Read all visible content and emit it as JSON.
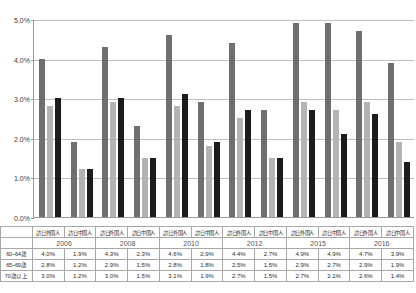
{
  "chart_data": {
    "type": "bar",
    "title": "",
    "xlabel": "",
    "ylabel": "",
    "ylim": [
      0,
      5
    ],
    "y_ticks": [
      "0.0%",
      "1.0%",
      "2.0%",
      "3.0%",
      "4.0%",
      "5.0%"
    ],
    "y_tick_values": [
      0,
      1,
      2,
      3,
      4,
      5
    ],
    "grid": true,
    "legend_position": "none",
    "categories": [
      "2006 訪日外国人",
      "2006 訪日中国人",
      "2008 訪日外国人",
      "2008 訪日中国人",
      "2010 訪日外国人",
      "2010 訪日中国人",
      "2012 訪日外国人",
      "2012 訪日中国人",
      "2015 訪日外国人",
      "2015 訪日中国人",
      "2016 訪日外国人",
      "2016 訪日中国人"
    ],
    "series": [
      {
        "name": "60~64歳",
        "color": "#6f6f6f",
        "values": [
          4.0,
          1.9,
          4.3,
          2.3,
          4.6,
          2.9,
          4.4,
          2.7,
          4.9,
          4.9,
          4.7,
          3.9
        ]
      },
      {
        "name": "65~69歳",
        "color": "#b3b3b3",
        "values": [
          2.8,
          1.2,
          2.9,
          1.5,
          2.8,
          1.8,
          2.5,
          1.5,
          2.9,
          2.7,
          2.9,
          1.9
        ]
      },
      {
        "name": "70歳以上",
        "color": "#1c1c1c",
        "values": [
          3.0,
          1.2,
          3.0,
          1.5,
          3.1,
          1.9,
          2.7,
          1.5,
          2.7,
          2.1,
          2.6,
          1.4
        ]
      }
    ]
  },
  "table": {
    "row_labels": [
      "60~64歳",
      "65~69歳",
      "70歳以上"
    ],
    "category_headers": [
      "訪日外国人",
      "訪日中国人",
      "訪日外国人",
      "訪日中国人",
      "訪日外国人",
      "訪日中国人",
      "訪日外国人",
      "訪日中国人",
      "訪日外国人",
      "訪日中国人",
      "訪日外国人",
      "訪日中国人"
    ],
    "year_headers": [
      "2006",
      "2008",
      "2010",
      "2012",
      "2015",
      "2016"
    ],
    "rows": [
      {
        "label": "60~64歳",
        "values": [
          "4.0%",
          "1.9%",
          "4.3%",
          "2.3%",
          "4.6%",
          "2.9%",
          "4.4%",
          "2.7%",
          "4.9%",
          "4.9%",
          "4.7%",
          "3.9%"
        ]
      },
      {
        "label": "65~69歳",
        "values": [
          "2.8%",
          "1.2%",
          "2.9%",
          "1.5%",
          "2.8%",
          "1.8%",
          "2.5%",
          "1.5%",
          "2.9%",
          "2.7%",
          "2.9%",
          "1.9%"
        ]
      },
      {
        "label": "70歳以上",
        "values": [
          "3.0%",
          "1.2%",
          "3.0%",
          "1.5%",
          "3.1%",
          "1.9%",
          "2.7%",
          "1.5%",
          "2.7%",
          "2.1%",
          "2.6%",
          "1.4%"
        ]
      }
    ]
  },
  "colors": {
    "series_60_64": "#6f6f6f",
    "series_65_69": "#b3b3b3",
    "series_70_plus": "#1c1c1c",
    "gridline": "#bdbdbd",
    "axis": "#9a9a9a",
    "table_border": "#a8a8a8"
  }
}
